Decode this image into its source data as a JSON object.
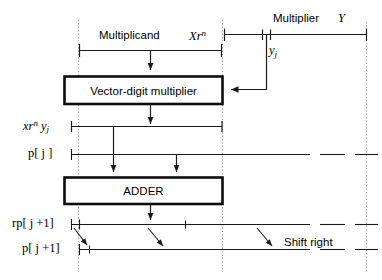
{
  "figure": {
    "background": "#ffffff",
    "line_color": "#1a1a1a",
    "dotted_color": "#8a8a8a"
  },
  "labels": {
    "multiplicand": "Multiplicand",
    "multiplicand_value": "Xr",
    "multiplicand_value_sup": "n",
    "multiplier": "Multiplier",
    "multiplier_value": "Y",
    "yj_base": "y",
    "yj_sub": "j",
    "partial_product_base": "xr",
    "partial_product_sup": "n",
    "partial_product_mid": " y",
    "partial_product_sub": "j",
    "p_j": "p[ j ]",
    "rp_j1": "rp[ j +1]",
    "p_j1": "p[ j +1]",
    "shift_right": "Shift right"
  },
  "blocks": [
    {
      "name": "vector-digit-multiplier",
      "label": "Vector-digit multiplier"
    },
    {
      "name": "adder",
      "label": "ADDER"
    }
  ]
}
